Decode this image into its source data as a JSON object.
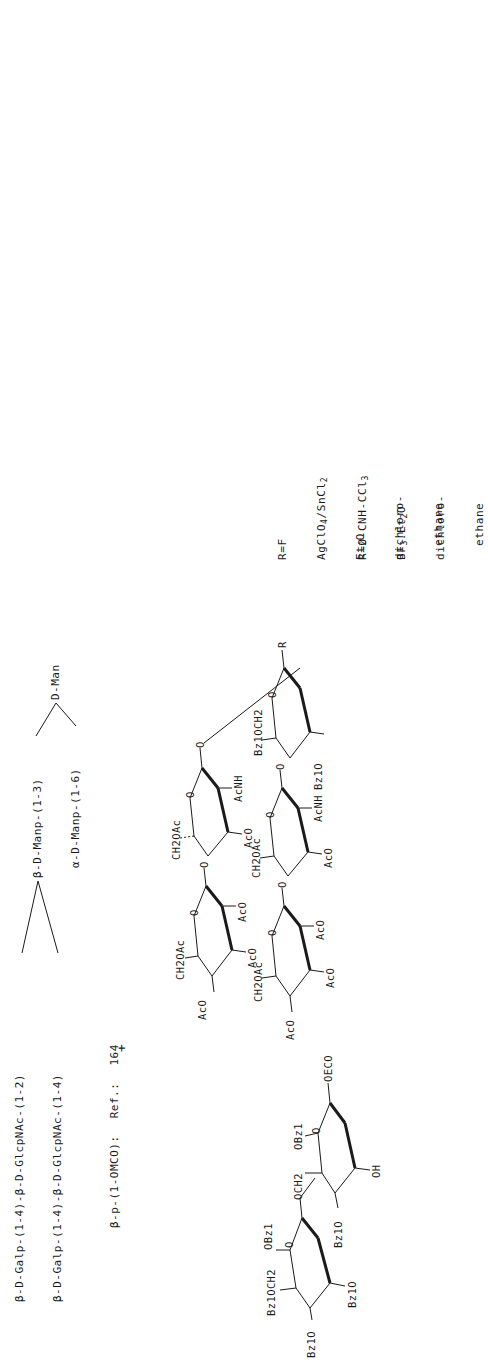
{
  "scheme": {
    "orientation": "rotated 90deg counter-clockwise",
    "target_sequence": {
      "line1": "β-D-Galp-(1-4)-β-D-GlcpNAc-(1-2)",
      "line2": "β-D-Galp-(1-4)-β-D-GlcpNAc-(1-4)",
      "branch_upper": "β-D-Manp-(1-3)",
      "branch_lower": "α-D-Manp-(1-6)",
      "core": "D-Man",
      "aglycone_note": "β-p-(1-OMCO):",
      "reference_label": "Ref.:",
      "reference_number": "164"
    },
    "acceptor": {
      "name": "trisaccharide acceptor",
      "labels": {
        "top_ring_6": "Bz1OCH2",
        "top_ring_1": "OBz1",
        "top_ring_ring_o": "O",
        "top_ring_4": "Bz1O",
        "top_ring_3": "Bz1O",
        "linker": "OCH2",
        "bottom_ring_2": "OBz1",
        "bottom_ring_o": "O",
        "bottom_ring_3": "Bz1O",
        "bottom_ring_4": "OH",
        "anomeric": "OECO"
      }
    },
    "plus_sign": "+",
    "donor": {
      "name": "hexasaccharide donor",
      "labels": {
        "gal1_oac_a": "AcO",
        "gal1_ch2": "CH2OAc",
        "gal1_oac_b": "AcO",
        "gal1_o": "O",
        "gal1_oac_c": "AcO",
        "link_o1": "O",
        "glc1_ch2": "CH2OAc",
        "glc1_o": "O",
        "glc1_oac": "AcO",
        "glc1_nh": "AcNH",
        "link_o2": "O",
        "gal2_oac_a": "AcO",
        "gal2_ch2": "CH2OAc",
        "gal2_o": "O",
        "gal2_oac_b": "AcO",
        "gal2_oac_c": "AcO",
        "link_o3": "O",
        "glc2_ch2": "CH2OAc",
        "glc2_o": "O",
        "glc2_oac": "AcO",
        "glc2_nh": "AcNH",
        "glc2_obz": "Bz1O",
        "link_o4": "O",
        "man_ch2": "Bz1OCH2",
        "man_o": "O",
        "man_obz": "Bz1O",
        "anomeric_r": "R"
      }
    },
    "conditions": [
      {
        "leaving_group": "R=F",
        "promoter": "AgClO4/SnCl2",
        "additive": "Et2O",
        "solvent_line1": "dichloro-",
        "solvent_line2": "ethane"
      },
      {
        "leaving_group": "R=O-CNH-CCl3",
        "promoter": "BF3.Et2O",
        "solvent_line1": "dichloro-",
        "solvent_line2": "ethane"
      }
    ]
  }
}
